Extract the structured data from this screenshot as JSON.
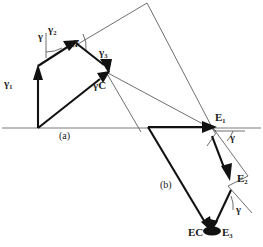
{
  "figure": {
    "panels": [
      {
        "id": "a",
        "label": "(a)"
      },
      {
        "id": "b",
        "label": "(b)"
      }
    ],
    "vector_labels": {
      "gamma_1": "γ₁",
      "gamma_2": "γ₂",
      "gamma_3": "γ₃",
      "gamma_c": "γC",
      "e_1": "E₁",
      "e_2": "E₂",
      "e_3": "E₃",
      "e_c": "EC"
    },
    "angle_labels": {
      "a_left": "γ",
      "a_mid": "γ",
      "b_upper": "γ",
      "b_lower": "γ"
    },
    "colors": {
      "vector_stroke": "#111111",
      "construction_stroke": "#555555",
      "baseline_stroke": "#6b6b6b",
      "background": "#ffffff",
      "text": "#1a1a1a"
    }
  }
}
